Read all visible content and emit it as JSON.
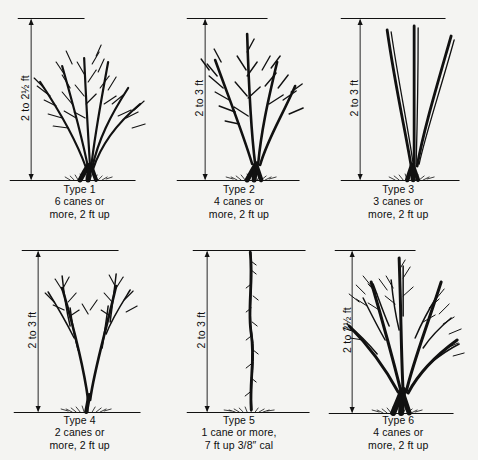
{
  "figure": {
    "background_color": "#f4f4f2",
    "ink_color": "#111111",
    "rows": 2,
    "columns": 3
  },
  "panels": [
    {
      "id": "type-1",
      "height_label": "2 to 2½ ft",
      "caption_line1": "Type 1",
      "caption_line2": "6 canes or",
      "caption_line3": "more, 2 ft up",
      "cane_count": 6,
      "form": "many-slender-arching-branched"
    },
    {
      "id": "type-2",
      "height_label": "2 to 3 ft",
      "caption_line1": "Type 2",
      "caption_line2": "4 canes or",
      "caption_line3": "more, 2 ft up",
      "cane_count": 4,
      "form": "branched-vase"
    },
    {
      "id": "type-3",
      "height_label": "2 to 3 ft",
      "caption_line1": "Type 3",
      "caption_line2": "3 canes or",
      "caption_line3": "more, 2 ft up",
      "cane_count": 3,
      "form": "unbranched-splayed"
    },
    {
      "id": "type-4",
      "height_label": "2 to 3 ft",
      "caption_line1": "Type 4",
      "caption_line2": "2 canes or",
      "caption_line3": "more, 2 ft up",
      "cane_count": 2,
      "form": "two-canes-branched-above"
    },
    {
      "id": "type-5",
      "height_label": "2 to 3 ft",
      "caption_line1": "Type 5",
      "caption_line2": "1 cane or more,",
      "caption_line3": "7 ft up 3/8″ cal",
      "cane_count": 1,
      "form": "single-whip"
    },
    {
      "id": "type-6",
      "height_label": "2 to 2½ ft",
      "caption_line1": "Type 6",
      "caption_line2": "4 canes or",
      "caption_line3": "more, 2 ft up",
      "cane_count": 4,
      "form": "heavy-branched-spreading"
    }
  ]
}
